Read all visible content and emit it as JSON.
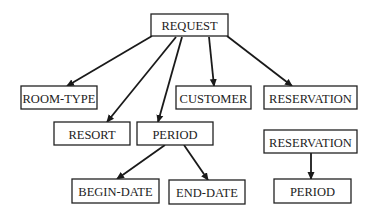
{
  "diagram": {
    "type": "tree",
    "colors": {
      "stroke": "#222222",
      "background": "#ffffff"
    },
    "nodes": [
      {
        "id": "request",
        "label": "REQUEST",
        "x": 151,
        "y": 14,
        "w": 77,
        "h": 22
      },
      {
        "id": "room-type",
        "label": "ROOM-TYPE",
        "x": 21,
        "y": 86,
        "w": 76,
        "h": 23
      },
      {
        "id": "customer",
        "label": "CUSTOMER",
        "x": 176,
        "y": 86,
        "w": 75,
        "h": 23
      },
      {
        "id": "reservation-1",
        "label": "RESERVATION",
        "x": 264,
        "y": 86,
        "w": 93,
        "h": 23
      },
      {
        "id": "resort",
        "label": "RESORT",
        "x": 54,
        "y": 122,
        "w": 76,
        "h": 23
      },
      {
        "id": "period-1",
        "label": "PERIOD",
        "x": 137,
        "y": 122,
        "w": 76,
        "h": 23
      },
      {
        "id": "reservation-2",
        "label": "RESERVATION",
        "x": 264,
        "y": 130,
        "w": 93,
        "h": 23
      },
      {
        "id": "begin-date",
        "label": "BEGIN-DATE",
        "x": 72,
        "y": 179,
        "w": 87,
        "h": 24
      },
      {
        "id": "end-date",
        "label": "END-DATE",
        "x": 169,
        "y": 180,
        "w": 76,
        "h": 24
      },
      {
        "id": "period-2",
        "label": "PERIOD",
        "x": 274,
        "y": 179,
        "w": 77,
        "h": 24
      }
    ],
    "edges": [
      {
        "from": "request",
        "to": "room-type",
        "x1": 152,
        "y1": 36,
        "x2": 67,
        "y2": 86
      },
      {
        "from": "request",
        "to": "resort",
        "x1": 176,
        "y1": 37,
        "x2": 107,
        "y2": 122
      },
      {
        "from": "request",
        "to": "period-1",
        "x1": 182,
        "y1": 37,
        "x2": 158,
        "y2": 122
      },
      {
        "from": "request",
        "to": "customer",
        "x1": 209,
        "y1": 37,
        "x2": 214,
        "y2": 86
      },
      {
        "from": "request",
        "to": "reservation-1",
        "x1": 227,
        "y1": 36,
        "x2": 292,
        "y2": 86
      },
      {
        "from": "period-1",
        "to": "begin-date",
        "x1": 165,
        "y1": 145,
        "x2": 117,
        "y2": 179
      },
      {
        "from": "period-1",
        "to": "end-date",
        "x1": 184,
        "y1": 145,
        "x2": 208,
        "y2": 180
      },
      {
        "from": "reservation-2",
        "to": "period-2",
        "x1": 311,
        "y1": 153,
        "x2": 311,
        "y2": 179
      }
    ]
  }
}
